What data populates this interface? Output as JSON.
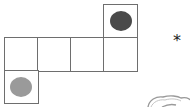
{
  "figure": {
    "type": "cube-net",
    "cell_size": 33,
    "cells": [
      {
        "id": "top-right",
        "row": 0,
        "col": 3,
        "mark": "dark-dot"
      },
      {
        "id": "mid-0",
        "row": 1,
        "col": 0,
        "mark": null
      },
      {
        "id": "mid-1",
        "row": 1,
        "col": 1,
        "mark": null
      },
      {
        "id": "mid-2",
        "row": 1,
        "col": 2,
        "mark": null
      },
      {
        "id": "mid-3",
        "row": 1,
        "col": 3,
        "mark": null
      },
      {
        "id": "bottom-left",
        "row": 2,
        "col": 0,
        "mark": "light-dot"
      }
    ],
    "colors": {
      "grid_line": "#6e6e6e",
      "dark_dot": "#4a4a4a",
      "light_dot": "#9a9a9a",
      "background": "#ffffff"
    },
    "side_symbol": "*",
    "partial_shape": "cloud-outline"
  }
}
